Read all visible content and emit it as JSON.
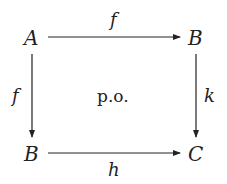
{
  "diagram": {
    "type": "commutative-square",
    "nodes": {
      "top_left": "A",
      "top_right": "B",
      "bottom_left": "B",
      "bottom_right": "C"
    },
    "arrows": {
      "top": "f",
      "left": "f",
      "right": "k",
      "bottom": "h"
    },
    "center_label": "p.o.",
    "colors": {
      "ink": "#222222",
      "background": "#ffffff"
    }
  }
}
